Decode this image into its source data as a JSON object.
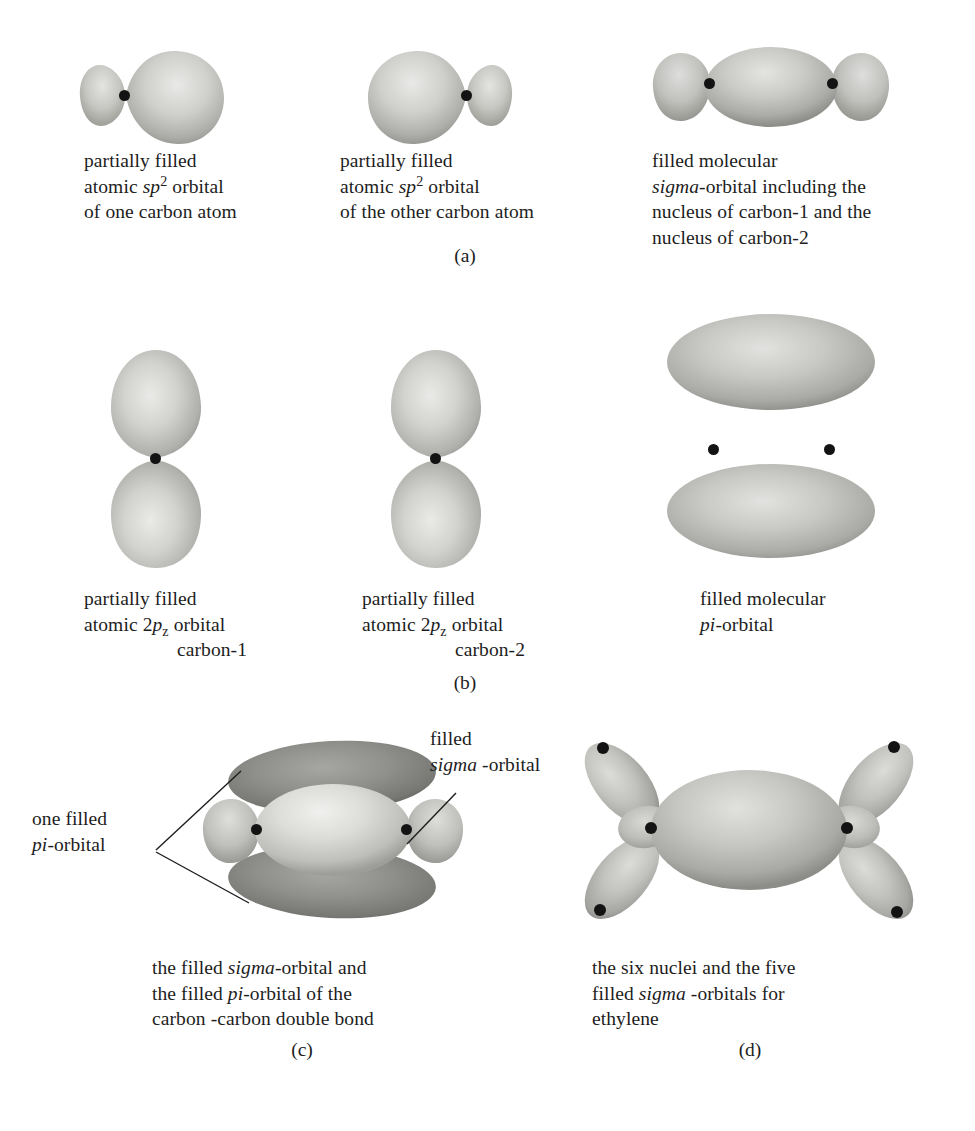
{
  "figure": {
    "panels": [
      {
        "id": "a",
        "label": "(a)",
        "items": [
          {
            "name": "partially-filled-sp2-orbital-carbon-one",
            "caption_lines": [
              "partially filled",
              "atomic sp2 orbital",
              "of one carbon atom"
            ],
            "caption_html": "partially filled\natomic <i>sp</i><sup>2</sup> orbital\nof one carbon atom",
            "orbital": "sp2-lobe-pair",
            "orientation": "horizontal-large-right",
            "nuclei": 1
          },
          {
            "name": "partially-filled-sp2-orbital-other-carbon",
            "caption_lines": [
              "partially filled",
              "atomic sp2 orbital",
              "of the other carbon atom"
            ],
            "caption_html": "partially filled\natomic <i>sp</i><sup>2</sup> orbital\nof the other carbon atom",
            "orbital": "sp2-lobe-pair",
            "orientation": "horizontal-large-left",
            "nuclei": 1
          },
          {
            "name": "filled-molecular-sigma-orbital",
            "caption_lines": [
              "filled molecular",
              "sigma-orbital including the",
              "nucleus of carbon-1 and the",
              "nucleus of carbon-2"
            ],
            "caption_html": "filled molecular\n<i>sigma</i>-orbital including the\nnucleus of carbon-1 and the\nnucleus of carbon-2",
            "orbital": "sigma-molecular",
            "orientation": "horizontal",
            "nuclei": 2
          }
        ]
      },
      {
        "id": "b",
        "label": "(b)",
        "items": [
          {
            "name": "partially-filled-2pz-orbital-carbon-1",
            "caption_lines": [
              "partially filled",
              "atomic 2pz orbital",
              "carbon-1"
            ],
            "caption_html": "partially filled\natomic 2<i>p</i><sub>z</sub> orbital\ncarbon-1",
            "orbital": "p-lobe-pair",
            "orientation": "vertical",
            "nuclei": 1
          },
          {
            "name": "partially-filled-2pz-orbital-carbon-2",
            "caption_lines": [
              "partially filled",
              "atomic 2pz orbital",
              "carbon-2"
            ],
            "caption_html": "partially filled\natomic 2<i>p</i><sub>z</sub> orbital\ncarbon-2",
            "orbital": "p-lobe-pair",
            "orientation": "vertical",
            "nuclei": 1
          },
          {
            "name": "filled-molecular-pi-orbital",
            "caption_lines": [
              "filled molecular",
              "pi-orbital"
            ],
            "caption_html": "filled molecular\n<i>pi</i>-orbital",
            "orbital": "pi-molecular",
            "orientation": "vertical-pair",
            "nuclei": 2
          }
        ]
      },
      {
        "id": "c",
        "label": "(c)",
        "items": [
          {
            "name": "sigma-and-pi-orbitals-of-double-bond",
            "caption_lines": [
              "the filled sigma-orbital and",
              "the filled pi-orbital of the",
              "carbon -carbon double bond"
            ],
            "caption_html": "the filled <i>sigma</i>-orbital and\nthe filled <i>pi</i>-orbital of the\ncarbon -carbon double bond",
            "orbital": "sigma-plus-pi",
            "nuclei": 2
          }
        ],
        "annotations": [
          {
            "name": "one-filled-pi-orbital-annotation",
            "lines": [
              "one filled",
              "pi-orbital"
            ],
            "html": "one filled\n<i>pi</i>-orbital",
            "points_to": [
              "upper-pi-lobe",
              "lower-pi-lobe"
            ]
          },
          {
            "name": "filled-sigma-orbital-annotation",
            "lines": [
              "filled",
              "sigma -orbital"
            ],
            "html": "filled\n<i>sigma</i> -orbital",
            "points_to": [
              "central-sigma-orbital"
            ]
          }
        ]
      },
      {
        "id": "d",
        "label": "(d)",
        "items": [
          {
            "name": "six-nuclei-five-sigma-orbitals-ethylene",
            "caption_lines": [
              "the six nuclei and the five",
              "filled sigma -orbitals for",
              "ethylene"
            ],
            "caption_html": "the six nuclei and the five\nfilled <i>sigma</i> -orbitals for\nethylene",
            "orbital": "ethylene-skeleton",
            "nuclei": 6,
            "sigma_orbitals": 5
          }
        ]
      }
    ]
  },
  "colors": {
    "page_background": "#ffffff",
    "text": "#1d1d1d",
    "orbital_light": "#d8d8d6",
    "orbital_mid": "#b9b9b5",
    "orbital_edge": "#8f8f8b",
    "orbital_dark": "#8a8a86",
    "orbital_dark_edge": "#6a6a66",
    "nucleus": "#131313",
    "leader_line": "#1d1d1d"
  }
}
